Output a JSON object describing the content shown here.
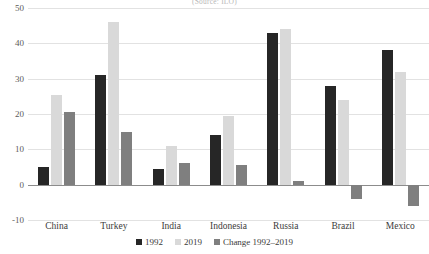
{
  "chart_data": {
    "type": "bar",
    "title": "",
    "subtitle": "(Source: ILO)",
    "xlabel": "",
    "ylabel": "",
    "ylim": [
      -10,
      50
    ],
    "yticks": [
      50,
      40,
      30,
      20,
      10,
      0,
      -10
    ],
    "grid": true,
    "legend_position": "bottom",
    "categories": [
      "China",
      "Turkey",
      "India",
      "Indonesia",
      "Russia",
      "Brazil",
      "Mexico"
    ],
    "series": [
      {
        "name": "1992",
        "color": "#262626",
        "values": [
          5,
          31,
          4.5,
          14,
          43,
          28,
          38
        ]
      },
      {
        "name": "2019",
        "color": "#d9d9d9",
        "values": [
          25.5,
          46,
          11,
          19.5,
          44,
          24,
          32
        ]
      },
      {
        "name": "Change 1992–2019",
        "color": "#7f7f7f",
        "values": [
          20.5,
          15,
          6,
          5.5,
          1,
          -4,
          -6
        ]
      }
    ]
  }
}
